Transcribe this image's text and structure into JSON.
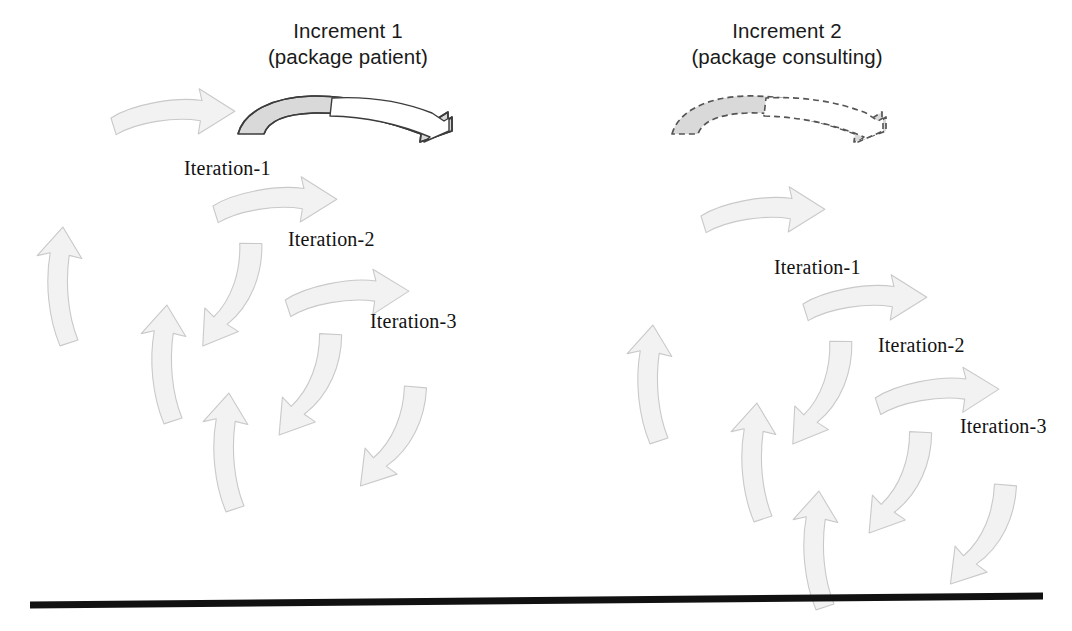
{
  "figure": {
    "background_color": "#ffffff",
    "arrow_fill": "#f2f2f2",
    "arrow_stroke": "#c9c9c9",
    "increment_arrow_stroke": "#3c3c3c",
    "increment_arrow_fill": "#d9d9d9",
    "baseline_color": "#111111"
  },
  "increments": [
    {
      "title_line1": "Increment 1",
      "title_line2": "(package patient)",
      "arrow_style": "solid",
      "iterations": [
        {
          "label": "Iteration-1"
        },
        {
          "label": "Iteration-2"
        },
        {
          "label": "Iteration-3"
        }
      ]
    },
    {
      "title_line1": "Increment 2",
      "title_line2": "(package consulting)",
      "arrow_style": "dashed",
      "iterations": [
        {
          "label": "Iteration-1"
        },
        {
          "label": "Iteration-2"
        },
        {
          "label": "Iteration-3"
        }
      ]
    }
  ],
  "baseline": {
    "description": "timeline"
  }
}
